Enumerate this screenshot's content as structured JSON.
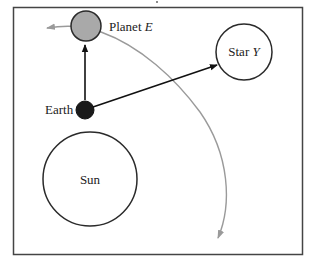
{
  "diagram": {
    "title_fragment": "",
    "bodies": {
      "planet": {
        "name": "Planet",
        "variable": "E",
        "cx": 86,
        "cy": 26,
        "r": 15,
        "fill": "#a9a9a9"
      },
      "star": {
        "name": "Star",
        "variable": "Y",
        "cx": 244,
        "cy": 52,
        "r": 28,
        "fill": "#ffffff"
      },
      "earth": {
        "name": "Earth",
        "cx": 85,
        "cy": 110,
        "r": 9,
        "fill": "#1a1a1a"
      },
      "sun": {
        "name": "Sun",
        "cx": 90,
        "cy": 179,
        "r": 47,
        "fill": "#ffffff"
      }
    },
    "arrows": [
      {
        "from": "Earth",
        "to": "Planet E",
        "description": "line of sight to Planet E"
      },
      {
        "from": "Earth",
        "to": "Star Y",
        "description": "line of sight to Star Y"
      }
    ],
    "orbit": {
      "description": "orbital path of Planet E with arrows at both ends",
      "color": "#9a9a9a"
    },
    "colors": {
      "frame": "#444444",
      "outline": "#2a2a2a",
      "orbit": "#9a9a9a",
      "arrow": "#111111"
    }
  }
}
